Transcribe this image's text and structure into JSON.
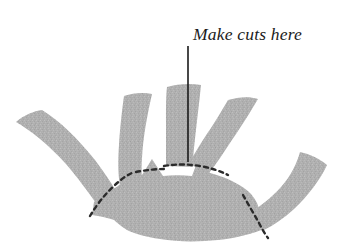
{
  "figure": {
    "title": "Make cuts here",
    "kind": "instructional-diagram",
    "background_color": "#ffffff"
  },
  "annotation": {
    "label_text": "Make cuts here",
    "label_style": "italic-serif",
    "label_color": "#1c1c1c",
    "leader_line": {
      "name": "leader-line",
      "color": "#1a1a1a",
      "width": 1.6,
      "x1": 188,
      "y1": 46,
      "x2": 188,
      "y2": 162
    }
  },
  "shape": {
    "name": "hand-form",
    "fill_color": "#b6b6b6",
    "texture": "mottled-halftone",
    "fingers": [
      {
        "name": "finger-1-far-left",
        "tip_x": 30,
        "tip_y": 124
      },
      {
        "name": "finger-2-left",
        "tip_x": 125,
        "tip_y": 96
      },
      {
        "name": "finger-3-center",
        "tip_x": 175,
        "tip_y": 86
      },
      {
        "name": "finger-4-right",
        "tip_x": 243,
        "tip_y": 98
      },
      {
        "name": "finger-5-far-right",
        "tip_x": 322,
        "tip_y": 155
      }
    ]
  },
  "cut_lines": {
    "name": "dashed-cut-lines",
    "color": "#2b2b2b",
    "stroke_width": 2.4,
    "dash_pattern": "4 4",
    "count": 4,
    "description": "Dashed guide lines marking where to cut between each finger"
  },
  "colors": {
    "shape_gray": "#b6b6b6",
    "shape_gray_light": "#c6c6c6",
    "shape_gray_dark": "#a8a8a8",
    "ink_black": "#1c1c1c",
    "dash_gray": "#2b2b2b",
    "paper_white": "#ffffff"
  }
}
